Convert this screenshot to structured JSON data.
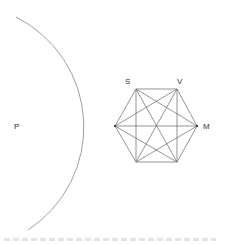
{
  "diagram": {
    "labels": {
      "p": "P",
      "s": "S",
      "v": "V",
      "m": "M"
    },
    "colors": {
      "stroke": "#777777",
      "text": "#333333",
      "background": "#ffffff"
    },
    "arc": {
      "center": [
        -40,
        128
      ],
      "radius": 123,
      "start": [
        16,
        17
      ],
      "end": [
        28,
        230
      ]
    },
    "hexagon": {
      "vertices": [
        [
          115,
          126
        ],
        [
          136,
          89
        ],
        [
          177,
          89
        ],
        [
          197,
          126
        ],
        [
          177,
          162
        ],
        [
          136,
          162
        ]
      ],
      "diagonals": "all"
    }
  }
}
